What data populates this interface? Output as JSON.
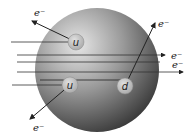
{
  "diagram": {
    "proton": {
      "cx": 97,
      "cy": 70,
      "r": 62,
      "color_light": "#e8e8e8",
      "color_dark": "#3a3a3a"
    },
    "quarks": [
      {
        "id": "u1",
        "label": "u",
        "cx": 76,
        "cy": 42,
        "r": 8
      },
      {
        "id": "u2",
        "label": "u",
        "cx": 70,
        "cy": 85,
        "r": 8
      },
      {
        "id": "d1",
        "label": "d",
        "cx": 125,
        "cy": 86,
        "r": 8
      }
    ],
    "electron_label": "e⁻",
    "labels": {
      "e1": "e⁻",
      "e2": "e⁻",
      "e3": "e⁻",
      "e4": "e⁻",
      "e5": "e⁻",
      "q_u1": "u",
      "q_u2": "u",
      "q_d1": "d"
    }
  }
}
